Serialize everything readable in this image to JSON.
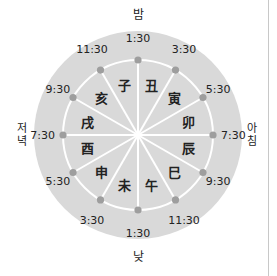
{
  "diagram": {
    "colors": {
      "outer_disc": "#d9d9d9",
      "divider_lines": "#ffffff",
      "time_dot": "#9e9e9e",
      "text": "#222222"
    },
    "direction_labels": {
      "top": "밤",
      "right": "아침",
      "bottom": "낮",
      "left": "저녁"
    },
    "times": [
      {
        "angle": 0,
        "label": "1:30"
      },
      {
        "angle": 30,
        "label": "3:30"
      },
      {
        "angle": 60,
        "label": "5:30"
      },
      {
        "angle": 90,
        "label": "7:30"
      },
      {
        "angle": 120,
        "label": "9:30"
      },
      {
        "angle": 150,
        "label": "11:30"
      },
      {
        "angle": 180,
        "label": "1:30"
      },
      {
        "angle": 210,
        "label": "3:30"
      },
      {
        "angle": 240,
        "label": "5:30"
      },
      {
        "angle": 270,
        "label": "7:30"
      },
      {
        "angle": 300,
        "label": "9:30"
      },
      {
        "angle": 330,
        "label": "11:30"
      }
    ],
    "branches": [
      {
        "angle": 15,
        "label": "丑"
      },
      {
        "angle": 45,
        "label": "寅"
      },
      {
        "angle": 75,
        "label": "卯"
      },
      {
        "angle": 105,
        "label": "辰"
      },
      {
        "angle": 135,
        "label": "巳"
      },
      {
        "angle": 165,
        "label": "午"
      },
      {
        "angle": 195,
        "label": "未"
      },
      {
        "angle": 225,
        "label": "申"
      },
      {
        "angle": 255,
        "label": "酉"
      },
      {
        "angle": 285,
        "label": "戌"
      },
      {
        "angle": 315,
        "label": "亥"
      },
      {
        "angle": 345,
        "label": "子"
      }
    ]
  }
}
